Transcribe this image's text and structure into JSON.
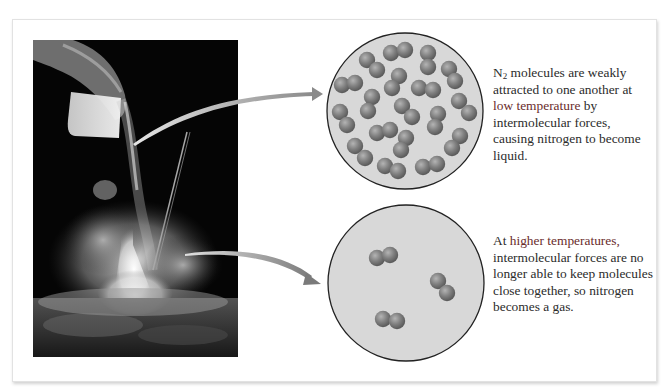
{
  "figure": {
    "photo": {
      "description": "Liquid nitrogen being poured from a beaker into an Erlenmeyer flask, with white vapor clouds"
    },
    "liquid_panel": {
      "molecule_formula": "N",
      "molecule_subscript": "2",
      "text_before_key": " molecules are weakly attracted to one another at ",
      "key_term": "low temperature",
      "text_after_key": " by intermolecular forces, causing nitrogen to become liquid.",
      "molecule_count": 18
    },
    "gas_panel": {
      "text_before_key": "At ",
      "key_term": "higher temperatures,",
      "text_after_key": " intermolecular forces are no longer able to keep molecules close together, so nitrogen becomes a gas.",
      "molecule_count": 3
    },
    "colors": {
      "panel_bg": "#ffffff",
      "circle_fill": "#d6d6d6",
      "circle_stroke": "#222222",
      "molecule": "#808080",
      "key_text": "#6a2c2c",
      "body_text": "#2b2b2b"
    }
  }
}
